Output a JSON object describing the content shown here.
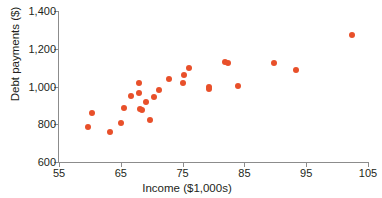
{
  "chart_data": {
    "type": "scatter",
    "title": "",
    "xlabel": "Income ($1,000s)",
    "ylabel": "Debt payments ($)",
    "xlim": [
      55,
      105
    ],
    "ylim": [
      600,
      1400
    ],
    "xticks": [
      "55",
      "65",
      "75",
      "85",
      "95",
      "105"
    ],
    "yticks": [
      "600",
      "800",
      "1,000",
      "1,200",
      "1,400"
    ],
    "xtick_values": [
      55,
      65,
      75,
      85,
      95,
      105
    ],
    "ytick_values": [
      600,
      800,
      1000,
      1200,
      1400
    ],
    "grid": false,
    "legend": null,
    "marker_color": "#e8502a",
    "points": [
      {
        "x": 59.7,
        "y": 787
      },
      {
        "x": 60.4,
        "y": 862
      },
      {
        "x": 63.2,
        "y": 759
      },
      {
        "x": 65.0,
        "y": 808
      },
      {
        "x": 65.5,
        "y": 888
      },
      {
        "x": 66.6,
        "y": 951
      },
      {
        "x": 67.9,
        "y": 1021
      },
      {
        "x": 68.0,
        "y": 964
      },
      {
        "x": 68.1,
        "y": 880
      },
      {
        "x": 68.4,
        "y": 876
      },
      {
        "x": 69.1,
        "y": 920
      },
      {
        "x": 69.7,
        "y": 825
      },
      {
        "x": 70.4,
        "y": 944
      },
      {
        "x": 71.2,
        "y": 982
      },
      {
        "x": 72.8,
        "y": 1040
      },
      {
        "x": 75.0,
        "y": 1019
      },
      {
        "x": 75.2,
        "y": 1062
      },
      {
        "x": 76.1,
        "y": 1099
      },
      {
        "x": 79.2,
        "y": 997
      },
      {
        "x": 79.3,
        "y": 988
      },
      {
        "x": 81.8,
        "y": 1128
      },
      {
        "x": 82.3,
        "y": 1124
      },
      {
        "x": 84.0,
        "y": 1003
      },
      {
        "x": 89.8,
        "y": 1125
      },
      {
        "x": 93.3,
        "y": 1088
      },
      {
        "x": 102.4,
        "y": 1272
      }
    ]
  }
}
